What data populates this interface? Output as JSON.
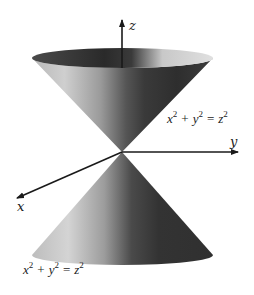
{
  "figure": {
    "axes": {
      "x_label": "x",
      "y_label": "y",
      "z_label": "z"
    },
    "equations": {
      "upper": {
        "x": "x",
        "y": "y",
        "z": "z",
        "exp_x": "2",
        "exp_y": "2",
        "exp_z": "2",
        "plus": "+",
        "equals": "="
      },
      "lower": {
        "x": "x",
        "y": "y",
        "z": "z",
        "exp_x": "2",
        "exp_y": "2",
        "exp_z": "2",
        "plus": "+",
        "equals": "="
      }
    },
    "colors": {
      "background": "#ffffff",
      "axis": "#1a1a1a",
      "cone_dark": "#2e2e2e",
      "cone_mid": "#6e6e6e",
      "cone_light": "#d8d8d8",
      "rim_interior": "#3a3a3a"
    }
  }
}
